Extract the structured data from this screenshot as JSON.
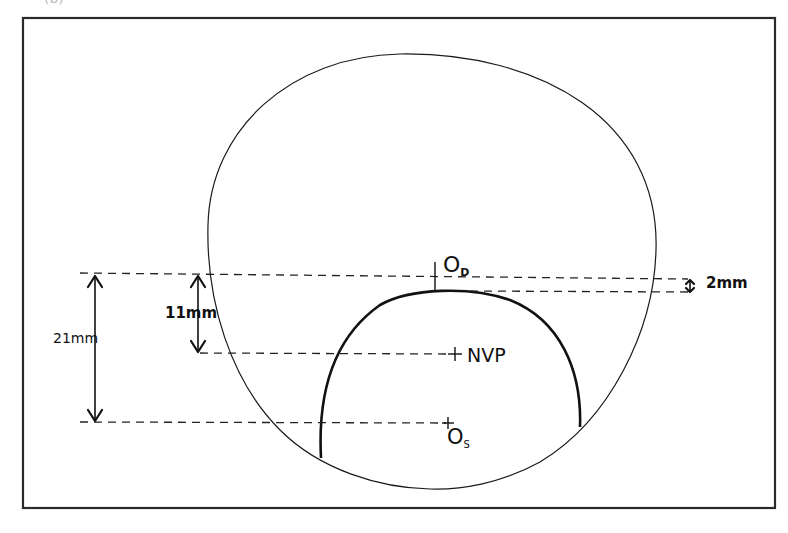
{
  "figure": {
    "panel_label_clipped": "(b)",
    "colors": {
      "stroke": "#111111",
      "frame": "#2a2a2a",
      "background": "#ffffff"
    }
  },
  "labels": {
    "distance_reference": "O",
    "distance_reference_sub": "D",
    "near_point": "NVP",
    "segment_center": "O",
    "segment_center_sub": "S",
    "dim_total": "21mm",
    "dim_near": "11mm",
    "dim_segment_drop": "2mm"
  },
  "points": {
    "O_D": {
      "x": 435,
      "y": 276
    },
    "NVP": {
      "x": 455,
      "y": 354
    },
    "O_S": {
      "x": 448,
      "y": 423
    },
    "segment_top": {
      "x": 440,
      "y": 290
    }
  },
  "dimensions": [
    {
      "label": "21mm",
      "from_y": 276,
      "to_y": 423
    },
    {
      "label": "11mm",
      "from_y": 276,
      "to_y": 354
    },
    {
      "label": "2mm",
      "from_y": 278,
      "to_y": 291
    }
  ]
}
